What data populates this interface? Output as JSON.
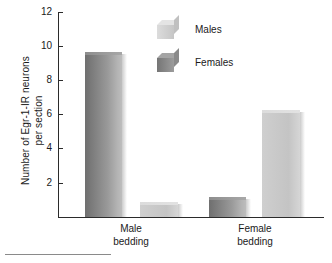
{
  "chart_data": {
    "type": "bar",
    "title": "",
    "xlabel": "",
    "ylabel": "Number of Egr-1-IR neurons\nper section",
    "ylim": [
      0,
      12
    ],
    "yticks": [
      2,
      4,
      6,
      8,
      10,
      12
    ],
    "ytick_labels": [
      "2",
      "4",
      "6",
      "8",
      "10",
      "12"
    ],
    "grid": false,
    "legend_position": "upper center",
    "categories": [
      "Male\nbedding",
      "Female\nbedding"
    ],
    "series": [
      {
        "name": "Males",
        "color": "#cacaca",
        "values": [
          9.5,
          6.1
        ]
      },
      {
        "name": "Females",
        "color": "#7d7d7d",
        "values": [
          0.7,
          1.0
        ]
      }
    ],
    "bars": [
      {
        "category": "Male bedding",
        "series": "Males",
        "value": 9.5,
        "shade": "dark"
      },
      {
        "category": "Male bedding",
        "series": "Females",
        "value": 0.7,
        "shade": "light"
      },
      {
        "category": "Female bedding",
        "series": "Females",
        "value": 1.0,
        "shade": "dark"
      },
      {
        "category": "Female bedding",
        "series": "Males",
        "value": 6.1,
        "shade": "light"
      }
    ]
  },
  "axis": {
    "y_title": "Number of Egr-1-IR neurons\nper section",
    "ticks": [
      {
        "label": "12"
      },
      {
        "label": "10"
      },
      {
        "label": "8"
      },
      {
        "label": "6"
      },
      {
        "label": "4"
      },
      {
        "label": "2"
      }
    ]
  },
  "legend": {
    "items": [
      {
        "label": "Males",
        "swatch": "light-cube-swatch"
      },
      {
        "label": "Females",
        "swatch": "dark-cube-swatch"
      }
    ]
  },
  "categories": [
    {
      "label": "Male\nbedding"
    },
    {
      "label": "Female\nbedding"
    }
  ]
}
